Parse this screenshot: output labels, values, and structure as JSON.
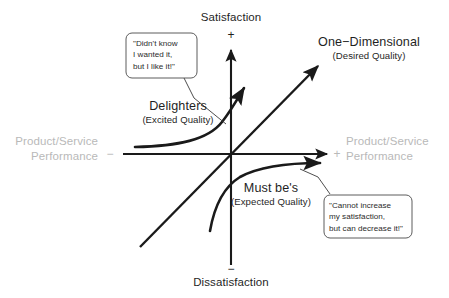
{
  "diagram": {
    "type": "kano-model-quadrant",
    "colors": {
      "axis": "#1a1a1a",
      "curve": "#1a1a1a",
      "muted_label": "#b9b9b9",
      "dark_label": "#1f1f1f",
      "callout_border": "#4a4a4a",
      "background": "#ffffff"
    }
  },
  "axes": {
    "vertical": {
      "top_label": "Satisfaction",
      "top_sign": "+",
      "bottom_label": "Dissatisfaction",
      "bottom_sign": "−"
    },
    "horizontal": {
      "left_label_line1": "Product/Service",
      "left_label_line2": "Performance",
      "left_sign": "−",
      "right_label_line1": "Product/Service",
      "right_label_line2": "Performance",
      "right_sign": "+"
    }
  },
  "categories": [
    {
      "id": "delighters",
      "name": "Delighters",
      "subtitle": "(Excited Quality)",
      "curve": "exponential-rising"
    },
    {
      "id": "one-dimensional",
      "name": "One−Dimensional",
      "subtitle": "(Desired Quality)",
      "curve": "linear-diagonal"
    },
    {
      "id": "must-bes",
      "name": "Must be's",
      "subtitle": "(Expected Quality)",
      "curve": "logarithmic-saturating"
    }
  ],
  "callouts": [
    {
      "id": "delighters-callout",
      "lines": [
        "\"Didn't know",
        "I wanted it,",
        "but I like it!\""
      ]
    },
    {
      "id": "must-bes-callout",
      "lines": [
        "\"Cannot increase",
        "my satisfaction,",
        "but can decrease it!\""
      ]
    }
  ]
}
